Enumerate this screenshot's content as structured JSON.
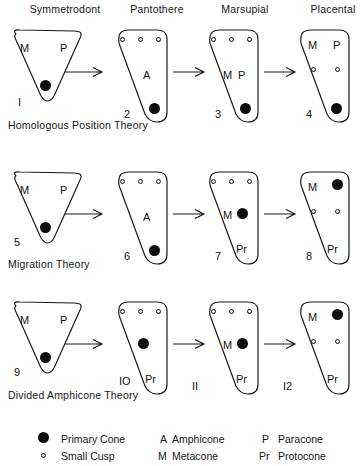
{
  "columns": [
    {
      "label": "Symmetrodont"
    },
    {
      "label": "Pantothere"
    },
    {
      "label": "Marsupial"
    },
    {
      "label": "Placental"
    }
  ],
  "rows": [
    {
      "theory": "Homologous Position Theory"
    },
    {
      "theory": "Migration Theory"
    },
    {
      "theory": "Divided Amphicone  Theory"
    }
  ],
  "panels": {
    "p1": {
      "number": "I",
      "labels": [
        "M",
        "P"
      ]
    },
    "p2": {
      "number": "2",
      "labels": [
        "A"
      ]
    },
    "p3": {
      "number": "3",
      "labels": [
        "M",
        "P"
      ]
    },
    "p4": {
      "number": "4",
      "labels": [
        "M",
        "P"
      ]
    },
    "p5": {
      "number": "5",
      "labels": [
        "M",
        "P"
      ]
    },
    "p6": {
      "number": "6",
      "labels": [
        "A"
      ]
    },
    "p7": {
      "number": "7",
      "labels": [
        "M",
        "Pr"
      ]
    },
    "p8": {
      "number": "8",
      "labels": [
        "M",
        "Pr"
      ]
    },
    "p9": {
      "number": "9",
      "labels": [
        "M",
        "P"
      ]
    },
    "p10": {
      "number": "IO",
      "labels": [
        "Pr"
      ]
    },
    "p11": {
      "number": "II",
      "labels": [
        "M",
        "Pr"
      ]
    },
    "p12": {
      "number": "I2",
      "labels": [
        "M",
        "Pr"
      ]
    }
  },
  "panel_text": {
    "p1_M": "M",
    "p1_P": "P",
    "p2_A": "A",
    "p3_M": "M",
    "p3_P": "P",
    "p4_M": "M",
    "p4_P": "P",
    "p5_M": "M",
    "p5_P": "P",
    "p6_A": "A",
    "p7_M": "M",
    "p7_Pr": "Pr",
    "p8_M": "M",
    "p8_Pr": "Pr",
    "p9_M": "M",
    "p9_P": "P",
    "p10_Pr": "Pr",
    "p11_M": "M",
    "p11_Pr": "Pr",
    "p12_M": "M",
    "p12_Pr": "Pr"
  },
  "legend": {
    "primary_cone": "Primary Cone",
    "small_cusp": "Small Cusp",
    "amphicone_key": "A",
    "amphicone": "Amphicone",
    "metacone_key": "M",
    "metacone": "Metacone",
    "paracone_key": "P",
    "paracone": "Paracone",
    "protocone_key": "Pr",
    "protocone": "Protocone"
  },
  "colors": {
    "ink": "#111111",
    "outline": "#1a1a1a",
    "primary_cone_fill": "#0d0d0d",
    "small_cusp_fill": "#ffffff",
    "background": "#ffffff"
  }
}
